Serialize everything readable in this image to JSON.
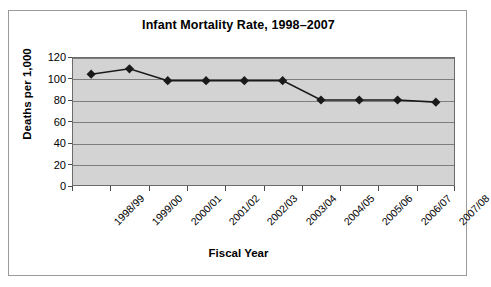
{
  "figure": {
    "title": "Infant Mortality Rate, 1998–2007",
    "background_color": "#ffffff",
    "plot_background_color": "#d3d3d3",
    "border_color": "#9a9a9a",
    "series_color": "#1a1a1a",
    "gridline_color": "#7d7d7d"
  },
  "chart_data": {
    "type": "line",
    "title": "Infant Mortality Rate, 1998–2007",
    "xlabel": "Fiscal Year",
    "ylabel": "Deaths per 1,000",
    "categories": [
      "1998/99",
      "1999/00",
      "2000/01",
      "2001/02",
      "2002/03",
      "2003/04",
      "2004/05",
      "2005/06",
      "2006/07",
      "2007/08"
    ],
    "values": [
      104,
      109,
      98,
      98,
      98,
      98,
      80,
      80,
      80,
      78
    ],
    "ylim": [
      0,
      120
    ],
    "yticks": [
      0,
      20,
      40,
      60,
      80,
      100,
      120
    ],
    "ytick_labels": [
      "0",
      "20",
      "40",
      "60",
      "80",
      "100",
      "120"
    ],
    "grid": true,
    "grid_axis": "y",
    "legend": false,
    "marker": "diamond",
    "marker_color": "#1a1a1a",
    "line_color": "#1a1a1a"
  }
}
